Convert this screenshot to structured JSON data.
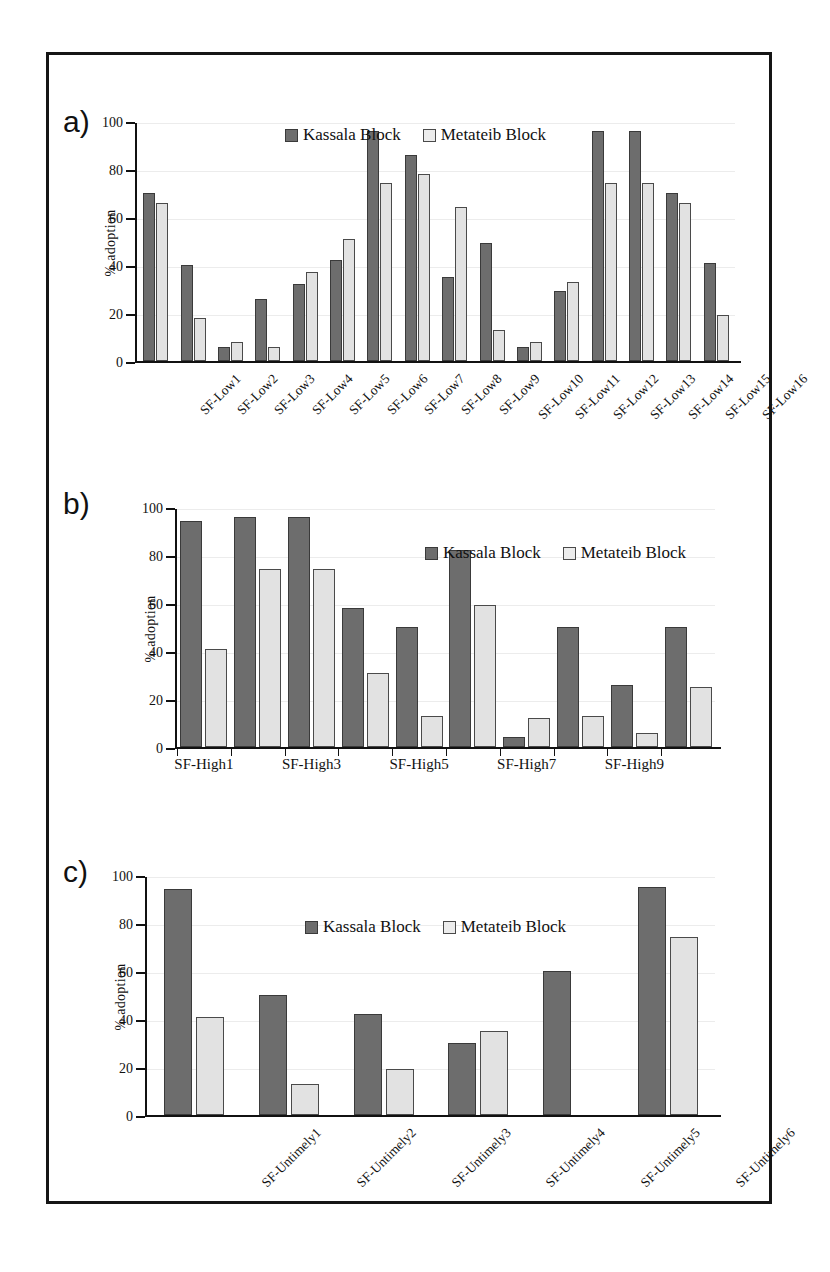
{
  "figure": {
    "panel_letters": {
      "a": "a)",
      "b": "b)",
      "c": "c)"
    },
    "legend": {
      "kassala": "Kassala Block",
      "metateib": "Metateib Block"
    },
    "colors": {
      "kassala": "#6d6d6d",
      "metateib": "#e2e2e2",
      "axis": "#111111",
      "frame": "#151515"
    }
  },
  "chart_data": [
    {
      "panel": "a)",
      "type": "bar",
      "title": "",
      "xlabel": "",
      "ylabel": "% adoption",
      "ylim": [
        0,
        100
      ],
      "yticks": [
        0,
        20,
        40,
        60,
        80,
        100
      ],
      "ytick_labels": [
        "0",
        "20",
        "40",
        "60",
        "80",
        "100"
      ],
      "grid": false,
      "legend_position": "top-center",
      "categories": [
        "SF-Low1",
        "SF-Low2",
        "SF-Low3",
        "SF-Low4",
        "SF-Low5",
        "SF-Low6",
        "SF-Low7",
        "SF-Low8",
        "SF-Low9",
        "SF-Low10",
        "SF-Low11",
        "SF-Low12",
        "SF-Low13",
        "SF-Low14",
        "SF-Low15",
        "SF-Low16"
      ],
      "series": [
        {
          "name": "Kassala Block",
          "values": [
            70,
            40,
            6,
            26,
            32,
            42,
            96,
            86,
            35,
            49,
            6,
            29,
            96,
            96,
            70,
            41
          ]
        },
        {
          "name": "Metateib Block",
          "values": [
            66,
            18,
            8,
            6,
            37,
            51,
            74,
            78,
            64,
            13,
            8,
            33,
            74,
            74,
            66,
            19
          ]
        }
      ]
    },
    {
      "panel": "b)",
      "type": "bar",
      "title": "",
      "xlabel": "",
      "ylabel": "% adoption",
      "ylim": [
        0,
        100
      ],
      "yticks": [
        0,
        20,
        40,
        60,
        80,
        100
      ],
      "ytick_labels": [
        "0",
        "20",
        "40",
        "60",
        "80",
        "100"
      ],
      "grid": false,
      "legend_position": "top-center",
      "categories": [
        "SF-High1",
        "SF-High2",
        "SF-High3",
        "SF-High4",
        "SF-High5",
        "SF-High6",
        "SF-High7",
        "SF-High8",
        "SF-High9",
        "SF-High10"
      ],
      "visible_tick_labels": [
        "SF-High1",
        "SF-High3",
        "SF-High5",
        "SF-High7",
        "SF-High9"
      ],
      "series": [
        {
          "name": "Kassala Block",
          "values": [
            94,
            96,
            96,
            58,
            50,
            82,
            4,
            50,
            26,
            50
          ]
        },
        {
          "name": "Metateib Block",
          "values": [
            41,
            74,
            74,
            31,
            13,
            59,
            12,
            13,
            6,
            25
          ]
        }
      ]
    },
    {
      "panel": "c)",
      "type": "bar",
      "title": "",
      "xlabel": "",
      "ylabel": "% adoption",
      "ylim": [
        0,
        100
      ],
      "yticks": [
        0,
        20,
        40,
        60,
        80,
        100
      ],
      "ytick_labels": [
        "0",
        "20",
        "40",
        "60",
        "80",
        "100"
      ],
      "grid": false,
      "legend_position": "top-center",
      "categories": [
        "SF-Untimely1",
        "SF-Untimely2",
        "SF-Untimely3",
        "SF-Untimely4",
        "SF-Untimely5",
        "SF-Untimely6"
      ],
      "series": [
        {
          "name": "Kassala Block",
          "values": [
            94,
            50,
            42,
            30,
            60,
            95
          ]
        },
        {
          "name": "Metateib Block",
          "values": [
            41,
            13,
            19,
            35,
            null,
            74
          ]
        }
      ]
    }
  ]
}
